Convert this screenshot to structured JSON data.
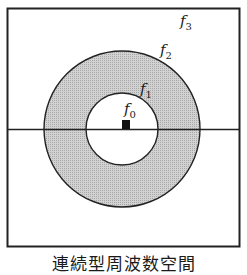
{
  "diagram": {
    "labels": {
      "f0": {
        "base": "f",
        "sub": "0"
      },
      "f1": {
        "base": "f",
        "sub": "1"
      },
      "f2": {
        "base": "f",
        "sub": "2"
      },
      "f3": {
        "base": "f",
        "sub": "3"
      }
    },
    "caption": "連続型周波数空間",
    "colors": {
      "ring_fill": "#c8c8c8",
      "stroke": "#222222",
      "background": "#ffffff"
    }
  }
}
